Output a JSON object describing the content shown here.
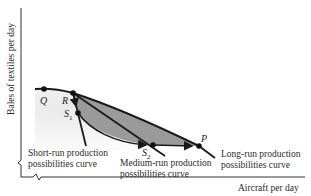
{
  "figure": {
    "type": "production possibilities diagram",
    "axes": {
      "y_label": "Bales of textiles per day",
      "x_label": "Aircraft per day",
      "axis_breaks": true
    },
    "points": {
      "Q": {
        "label": "Q",
        "sub": ""
      },
      "R": {
        "label": "R",
        "sub": ""
      },
      "S1": {
        "label": "S",
        "sub": "1"
      },
      "S2": {
        "label": "S",
        "sub": "2"
      },
      "P": {
        "label": "P",
        "sub": ""
      }
    },
    "curves": {
      "short_run": {
        "line1": "Short-run production",
        "line2": "possibilities curve"
      },
      "medium_run": {
        "line1": "Medium-run production",
        "line2": "possibilities curve"
      },
      "long_run": {
        "line1": "Long-run production",
        "line2": "possibilities curve"
      }
    },
    "colors": {
      "shaded_region": "#9a9a9a",
      "light_region": "#ececec",
      "curve": "#1a1a1a",
      "axis": "#333333"
    }
  }
}
